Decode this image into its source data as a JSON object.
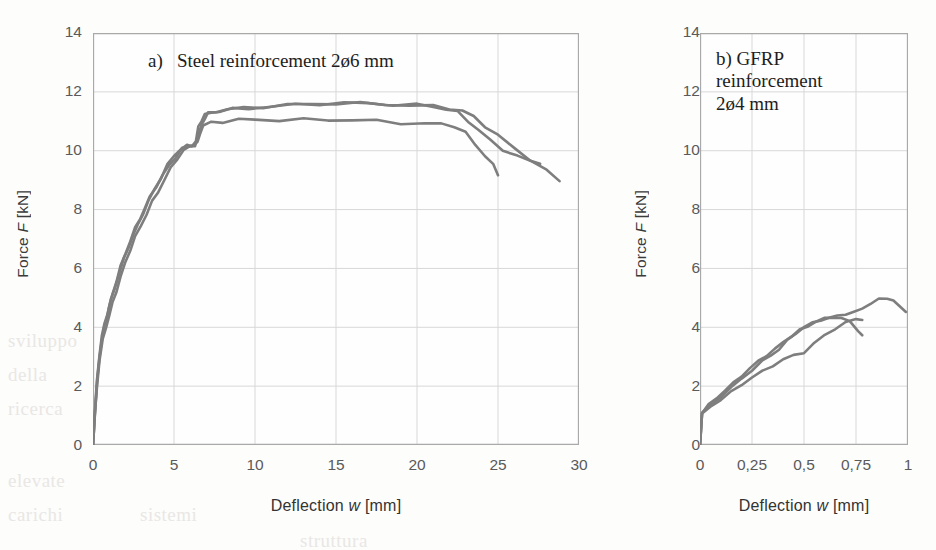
{
  "figure": {
    "background_color": "#fdfdfc",
    "curve_color": "#7e7e7e",
    "grid_color": "#d6d6d6",
    "axis_color": "#9a9a9a",
    "tick_text_color": "#5a5a5a",
    "ghost_text": [
      "sviluppo",
      "della",
      "ricerca",
      "elevate",
      "carichi",
      "sistemi",
      "struttura"
    ]
  },
  "chart_data": [
    {
      "id": "a",
      "type": "line",
      "title": "a)   Steel reinforcement 2ø6 mm",
      "xlabel": "Deflection w [mm]",
      "ylabel": "Force F [kN]",
      "xlim": [
        0,
        30
      ],
      "ylim": [
        0,
        14
      ],
      "xticks": [
        "0",
        "5",
        "10",
        "15",
        "20",
        "25",
        "30"
      ],
      "xtick_values": [
        0,
        5,
        10,
        15,
        20,
        25,
        30
      ],
      "yticks": [
        "0",
        "2",
        "4",
        "6",
        "8",
        "10",
        "12",
        "14"
      ],
      "ytick_values": [
        0,
        2,
        4,
        6,
        8,
        10,
        12,
        14
      ],
      "grid": true,
      "legend": "none",
      "series": [
        {
          "name": "specimen-1",
          "x": [
            0,
            0.12,
            0.25,
            0.4,
            0.55,
            0.7,
            0.85,
            1.0,
            1.2,
            1.45,
            1.7,
            2.0,
            2.3,
            2.6,
            2.9,
            3.2,
            3.5,
            3.9,
            4.3,
            4.7,
            5.1,
            5.5,
            5.9,
            6.2,
            6.45,
            6.6,
            6.8,
            7.3,
            8.0,
            9.0,
            10.0,
            11.5,
            13.0,
            14.5,
            16.0,
            17.5,
            19.0,
            20.5,
            21.5,
            22.3,
            23.0,
            23.6,
            24.2,
            24.7,
            25.0
          ],
          "y": [
            0,
            1.1,
            2.1,
            3.0,
            3.6,
            4.0,
            4.35,
            4.7,
            5.1,
            5.6,
            6.05,
            6.5,
            6.95,
            7.35,
            7.7,
            8.05,
            8.4,
            8.8,
            9.15,
            9.5,
            9.8,
            10.05,
            10.15,
            10.2,
            10.25,
            10.6,
            10.85,
            10.95,
            11.0,
            11.05,
            11.05,
            11.05,
            11.05,
            11.05,
            11.05,
            11.0,
            10.95,
            10.92,
            10.9,
            10.85,
            10.6,
            10.2,
            9.85,
            9.5,
            9.2
          ]
        },
        {
          "name": "specimen-2",
          "x": [
            0,
            0.12,
            0.25,
            0.4,
            0.55,
            0.7,
            0.9,
            1.1,
            1.35,
            1.6,
            1.9,
            2.2,
            2.5,
            2.8,
            3.1,
            3.45,
            3.8,
            4.2,
            4.6,
            5.0,
            5.4,
            5.8,
            6.1,
            6.35,
            6.5,
            6.7,
            6.9,
            7.3,
            7.8,
            8.6,
            9.6,
            11.0,
            12.5,
            14.0,
            15.5,
            17.0,
            18.5,
            20.0,
            21.0,
            21.8,
            22.5,
            23.2,
            23.8,
            24.5,
            25.3,
            26.2,
            27.0,
            27.6
          ],
          "y": [
            0,
            1.15,
            2.2,
            3.1,
            3.7,
            4.1,
            4.5,
            4.9,
            5.35,
            5.8,
            6.3,
            6.75,
            7.15,
            7.5,
            7.9,
            8.3,
            8.7,
            9.1,
            9.5,
            9.85,
            10.05,
            10.15,
            10.2,
            10.3,
            10.8,
            11.05,
            11.2,
            11.3,
            11.35,
            11.4,
            11.45,
            11.5,
            11.55,
            11.6,
            11.62,
            11.6,
            11.58,
            11.55,
            11.5,
            11.42,
            11.3,
            11.0,
            10.7,
            10.35,
            10.05,
            9.8,
            9.65,
            9.6
          ]
        },
        {
          "name": "specimen-3",
          "x": [
            0,
            0.12,
            0.25,
            0.4,
            0.6,
            0.8,
            1.0,
            1.2,
            1.45,
            1.7,
            2.0,
            2.3,
            2.6,
            2.95,
            3.3,
            3.65,
            4.0,
            4.4,
            4.8,
            5.2,
            5.6,
            6.0,
            6.3,
            6.5,
            6.7,
            6.9,
            7.1,
            7.6,
            8.3,
            9.3,
            10.5,
            12.0,
            13.5,
            15.0,
            16.5,
            18.0,
            19.5,
            21.0,
            22.0,
            22.8,
            23.5,
            24.2,
            25.0,
            26.0,
            27.0,
            28.0,
            28.8
          ],
          "y": [
            0,
            1.05,
            2.0,
            2.9,
            3.55,
            4.0,
            4.4,
            4.8,
            5.25,
            5.7,
            6.2,
            6.65,
            7.05,
            7.45,
            7.85,
            8.25,
            8.6,
            9.0,
            9.4,
            9.75,
            10.0,
            10.15,
            10.2,
            10.5,
            10.9,
            11.1,
            11.25,
            11.35,
            11.4,
            11.45,
            11.5,
            11.55,
            11.58,
            11.62,
            11.6,
            11.58,
            11.55,
            11.5,
            11.45,
            11.35,
            11.15,
            10.85,
            10.5,
            10.1,
            9.7,
            9.3,
            9.0
          ]
        }
      ]
    },
    {
      "id": "b",
      "type": "line",
      "title": "b)   GFRP\nreinforcement\n2ø4 mm",
      "xlabel": "Deflection w [mm]",
      "ylabel": "Force F [kN]",
      "xlim": [
        0,
        1
      ],
      "ylim": [
        0,
        14
      ],
      "xticks": [
        "0",
        "0,25",
        "0,5",
        "0,75",
        "1"
      ],
      "xtick_values": [
        0,
        0.25,
        0.5,
        0.75,
        1
      ],
      "yticks": [
        "0",
        "2",
        "4",
        "6",
        "8",
        "10",
        "12",
        "14"
      ],
      "ytick_values": [
        0,
        2,
        4,
        6,
        8,
        10,
        12,
        14
      ],
      "grid": true,
      "legend": "none",
      "series": [
        {
          "name": "specimen-1",
          "x": [
            0,
            0.01,
            0.04,
            0.08,
            0.12,
            0.16,
            0.2,
            0.24,
            0.28,
            0.32,
            0.36,
            0.4,
            0.44,
            0.48,
            0.52,
            0.56,
            0.6,
            0.64,
            0.68,
            0.72,
            0.76,
            0.78
          ],
          "y": [
            0,
            1.1,
            1.35,
            1.6,
            1.85,
            2.1,
            2.35,
            2.6,
            2.85,
            3.05,
            3.25,
            3.5,
            3.7,
            3.9,
            4.05,
            4.2,
            4.3,
            4.35,
            4.3,
            4.2,
            3.9,
            3.7
          ]
        },
        {
          "name": "specimen-2",
          "x": [
            0,
            0.01,
            0.05,
            0.1,
            0.15,
            0.2,
            0.25,
            0.3,
            0.34,
            0.38,
            0.42,
            0.46,
            0.5,
            0.54,
            0.58,
            0.62,
            0.66,
            0.7,
            0.74,
            0.78,
            0.82,
            0.86,
            0.9,
            0.93,
            0.96,
            0.99
          ],
          "y": [
            0,
            1.1,
            1.35,
            1.65,
            1.95,
            2.25,
            2.55,
            2.85,
            3.05,
            3.25,
            3.55,
            3.8,
            4.0,
            4.15,
            4.25,
            4.3,
            4.4,
            4.45,
            4.5,
            4.65,
            4.8,
            4.95,
            5.0,
            4.9,
            4.7,
            4.55
          ]
        },
        {
          "name": "specimen-3",
          "x": [
            0,
            0.01,
            0.05,
            0.1,
            0.15,
            0.2,
            0.25,
            0.3,
            0.35,
            0.4,
            0.45,
            0.5,
            0.55,
            0.6,
            0.65,
            0.7,
            0.75,
            0.78
          ],
          "y": [
            0,
            1.05,
            1.3,
            1.55,
            1.8,
            2.05,
            2.3,
            2.5,
            2.7,
            2.9,
            3.05,
            3.15,
            3.45,
            3.75,
            3.95,
            4.15,
            4.3,
            4.25
          ]
        }
      ]
    }
  ]
}
